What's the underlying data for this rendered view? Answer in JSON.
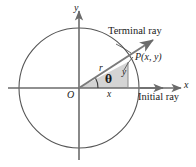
{
  "figure": {
    "colors": {
      "stroke": "#555555",
      "axis": "#6b6b6b",
      "ray": "#7a7a7a",
      "triangle_fill": "#d4d4d4",
      "text": "#1a1a1a",
      "background": "#ffffff"
    }
  },
  "labels": {
    "y_axis": "y",
    "x_axis": "x",
    "origin": "O",
    "terminal_ray": "Terminal ray",
    "initial_ray": "Initial ray",
    "point": "P(x, y)",
    "radius": "r",
    "angle": "θ",
    "leg_horizontal": "x",
    "leg_vertical": "y"
  },
  "geometry": {
    "center": [
      79,
      88
    ],
    "radius_px": 60,
    "point_P": [
      128,
      62
    ],
    "angle_degrees": 28
  }
}
